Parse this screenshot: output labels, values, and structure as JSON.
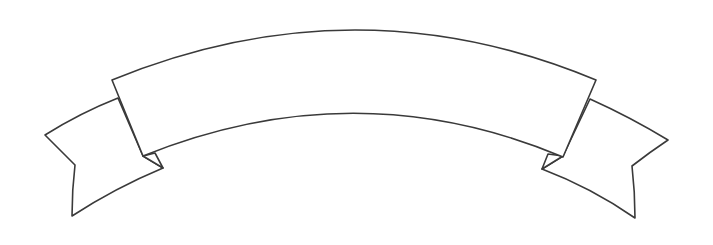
{
  "illustration": {
    "subject": "blank curved ribbon banner",
    "style": "black outline line art on white",
    "colors": {
      "background": "#ffffff",
      "outline": "#3a3a3a",
      "fill": "#ffffff"
    },
    "parts": [
      "left-tail",
      "left-fold",
      "main-band",
      "right-fold",
      "right-tail"
    ],
    "banner_text": ""
  }
}
